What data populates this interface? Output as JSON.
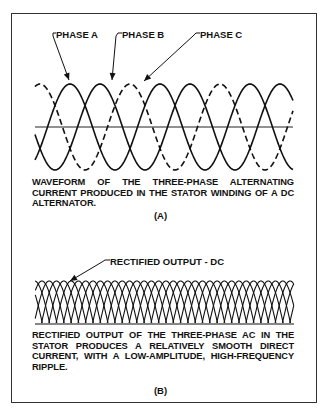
{
  "panel_a": {
    "labels": {
      "phase_a": "PHASE A",
      "phase_b": "PHASE B",
      "phase_c": "PHASE C"
    },
    "caption": "WAVEFORM OF THE THREE-PHASE ALTERNATING CURRENT PRODUCED IN THE STATOR WINDING OF A DC ALTERNATOR.",
    "panel_label": "(A)",
    "waveform": {
      "x_start": 35,
      "x_end": 293,
      "axis_y": 127,
      "amplitude": 43,
      "period": 90,
      "phases": [
        {
          "name": "PHASE A",
          "first_peak_x": 70,
          "style": "solid"
        },
        {
          "name": "PHASE B",
          "first_peak_x": 100,
          "style": "solid"
        },
        {
          "name": "PHASE C",
          "first_peak_x": 130,
          "style": "dashed"
        }
      ]
    }
  },
  "panel_b": {
    "labels": {
      "rectified": "RECTIFIED OUTPUT - DC"
    },
    "caption": "RECTIFIED OUTPUT OF THE THREE-PHASE AC IN THE STATOR PRODUCES A RELATIVELY SMOOTH DIRECT CURRENT, WITH A LOW-AMPLITUDE, HIGH-FREQUENCY RIPPLE.",
    "panel_label": "(B)",
    "waveform": {
      "x_start": 35,
      "x_end": 294,
      "top_y": 281,
      "base_y": 323,
      "pulse_spacing": 7.3,
      "pulse_width": 30
    }
  }
}
